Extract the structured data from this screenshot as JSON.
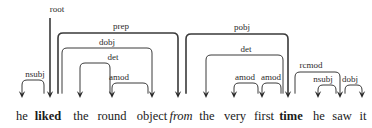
{
  "figure": {
    "type": "dependency-parse-tree",
    "background_color": "#ffffff",
    "arc_color": "#3a3a3a",
    "text_color": "#1a1a1a",
    "sentence": "he liked the round object from the very first time he saw it"
  },
  "tokens": [
    {
      "id": 0,
      "text": "he",
      "x": 22,
      "style": "regular"
    },
    {
      "id": 1,
      "text": "liked",
      "x": 48,
      "style": "bold"
    },
    {
      "id": 2,
      "text": "the",
      "x": 81,
      "style": "regular"
    },
    {
      "id": 3,
      "text": "round",
      "x": 112,
      "style": "regular"
    },
    {
      "id": 4,
      "text": "object",
      "x": 152,
      "style": "regular"
    },
    {
      "id": 5,
      "text": "from",
      "x": 181,
      "style": "italic"
    },
    {
      "id": 6,
      "text": "the",
      "x": 207,
      "style": "regular"
    },
    {
      "id": 7,
      "text": "very",
      "x": 235,
      "style": "regular"
    },
    {
      "id": 8,
      "text": "first",
      "x": 264,
      "style": "regular"
    },
    {
      "id": 9,
      "text": "time",
      "x": 291,
      "style": "bold"
    },
    {
      "id": 10,
      "text": "he",
      "x": 319,
      "style": "regular"
    },
    {
      "id": 11,
      "text": "saw",
      "x": 342,
      "style": "regular"
    },
    {
      "id": 12,
      "text": "it",
      "x": 363,
      "style": "regular"
    }
  ],
  "root_arrow": {
    "label": "root",
    "label_x": 57,
    "label_y": 12,
    "line_x": 50,
    "top_y": 18,
    "target_y": 98
  },
  "arcs": [
    {
      "label": "nsubj",
      "head_x": 44,
      "dep_x": 22,
      "top_y": 80,
      "label_x": 35,
      "label_y": 77,
      "thick": false
    },
    {
      "label": "prep",
      "head_x": 58,
      "dep_x": 178,
      "top_y": 33,
      "label_x": 121,
      "label_y": 29,
      "thick": true
    },
    {
      "label": "dobj",
      "head_x": 62,
      "dep_x": 152,
      "top_y": 48,
      "label_x": 107,
      "label_y": 45,
      "thick": false
    },
    {
      "label": "det",
      "head_x": 110,
      "dep_x": 80,
      "top_y": 63,
      "label_x": 113,
      "label_y": 60,
      "thick": false
    },
    {
      "label": "amod",
      "head_x": 148,
      "dep_x": 112,
      "top_y": 83,
      "label_x": 119,
      "label_y": 80,
      "thick": false
    },
    {
      "label": "pobj",
      "head_x": 186,
      "dep_x": 288,
      "top_y": 34,
      "label_x": 242,
      "label_y": 30,
      "thick": true
    },
    {
      "label": "det",
      "head_x": 283,
      "dep_x": 206,
      "top_y": 55,
      "label_x": 246,
      "label_y": 52,
      "thick": false
    },
    {
      "label": "amod",
      "head_x": 258,
      "dep_x": 234,
      "top_y": 83,
      "label_x": 245,
      "label_y": 80,
      "thick": false
    },
    {
      "label": "amod",
      "head_x": 281,
      "dep_x": 262,
      "top_y": 83,
      "label_x": 271,
      "label_y": 80,
      "thick": false
    },
    {
      "label": "rcmod",
      "head_x": 295,
      "dep_x": 340,
      "top_y": 72,
      "label_x": 311,
      "label_y": 68,
      "thick": false
    },
    {
      "label": "nsubj",
      "head_x": 336,
      "dep_x": 318,
      "top_y": 85,
      "label_x": 323,
      "label_y": 82,
      "thick": false
    },
    {
      "label": "dobj",
      "head_x": 345,
      "dep_x": 362,
      "top_y": 85,
      "label_x": 350,
      "label_y": 82,
      "thick": false
    }
  ],
  "geometry": {
    "baseline_y": 98,
    "corner_radius": 5,
    "arrow_width": 3.2,
    "arrow_length": 7
  }
}
